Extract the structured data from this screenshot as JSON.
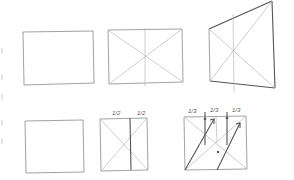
{
  "rows": [
    {
      "name": "top-row",
      "figures": [
        {
          "name": "plain-rectangle"
        },
        {
          "name": "rectangle-with-diagonals-and-center-line"
        },
        {
          "name": "perspective-rectangle-with-diagonals"
        }
      ]
    },
    {
      "name": "bottom-row",
      "figures": [
        {
          "name": "plain-rectangle"
        },
        {
          "name": "rectangle-halved",
          "labels": [
            "1/2",
            "1/2"
          ]
        },
        {
          "name": "rectangle-thirds",
          "labels": [
            "1/3",
            "1/3",
            "1/3"
          ]
        }
      ]
    }
  ],
  "labels": {
    "half_left": "1/2",
    "half_right": "1/2",
    "third_1": "1/3",
    "third_2": "1/3",
    "third_3": "1/3"
  }
}
